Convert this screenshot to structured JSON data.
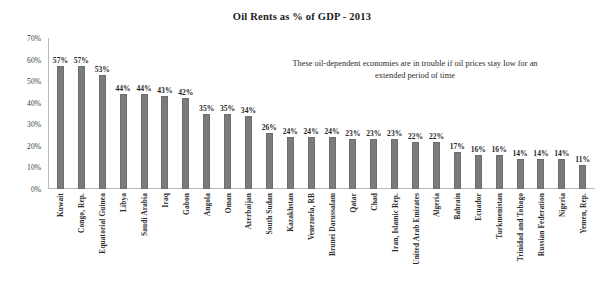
{
  "chart_data": {
    "type": "bar",
    "title": "Oil Rents as % of GDP - 2013",
    "xlabel": "",
    "ylabel": "",
    "ylim": [
      0,
      70
    ],
    "ytick_labels": [
      "70%",
      "60%",
      "50%",
      "40%",
      "30%",
      "20%",
      "10%",
      "0%"
    ],
    "ytick_values": [
      70,
      60,
      50,
      40,
      30,
      20,
      10,
      0
    ],
    "grid": false,
    "legend": "none",
    "annotation": "These oil-dependent economies are in trouble if oil prices stay low for an extended period of time",
    "bar_color": "#7b7b7b",
    "categories": [
      "Kuwait",
      "Congo, Rep.",
      "Equatorial Guinea",
      "Libya",
      "Saudi Arabia",
      "Iraq",
      "Gabon",
      "Angola",
      "Oman",
      "Azerbaijan",
      "South Sudan",
      "Kazakhstan",
      "Venezuela, RB",
      "Brunei Darussalam",
      "Qatar",
      "Chad",
      "Iran, Islamic Rep.",
      "United Arab Emirates",
      "Algeria",
      "Bahrain",
      "Ecuador",
      "Turkmenistan",
      "Trinidad and Tobago",
      "Russian Federation",
      "Nigeria",
      "Yemen, Rep."
    ],
    "values": [
      57,
      57,
      53,
      44,
      44,
      43,
      42,
      35,
      35,
      34,
      26,
      24,
      24,
      24,
      23,
      23,
      23,
      22,
      22,
      17,
      16,
      16,
      14,
      14,
      14,
      11
    ],
    "data_labels": [
      "57%",
      "57%",
      "53%",
      "44%",
      "44%",
      "43%",
      "42%",
      "35%",
      "35%",
      "34%",
      "26%",
      "24%",
      "24%",
      "24%",
      "23%",
      "23%",
      "23%",
      "22%",
      "22%",
      "17%",
      "16%",
      "16%",
      "14%",
      "14%",
      "14%",
      "11%"
    ]
  }
}
